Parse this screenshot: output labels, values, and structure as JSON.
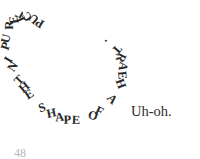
{
  "panel": {
    "background_color": "#ffffff",
    "text_color": "#272727"
  },
  "heart_caption": {
    "full_text": "PUCKER UP IN THE SHAPE OF A HEART.",
    "shape": "heart",
    "description": "caption lettering set along a heart-shaped path",
    "glyphs": [
      {
        "char": "P",
        "x": 36.0,
        "y": 17.0,
        "rot": 212
      },
      {
        "char": "U",
        "x": 29.5,
        "y": 12.5,
        "rot": 222
      },
      {
        "char": "C",
        "x": 22.5,
        "y": 10.5,
        "rot": 234
      },
      {
        "char": "K",
        "x": 15.5,
        "y": 10.5,
        "rot": 247
      },
      {
        "char": "E",
        "x": 9.5,
        "y": 13.5,
        "rot": 259
      },
      {
        "char": "R",
        "x": 5.0,
        "y": 19.0,
        "rot": 270
      },
      {
        "char": " ",
        "x": 2.5,
        "y": 25.5,
        "rot": 278
      },
      {
        "char": "U",
        "x": 1.5,
        "y": 32.5,
        "rot": 285
      },
      {
        "char": "P",
        "x": 2.0,
        "y": 40.0,
        "rot": 291
      },
      {
        "char": " ",
        "x": 3.5,
        "y": 47.0,
        "rot": 296
      },
      {
        "char": "I",
        "x": 6.0,
        "y": 53.5,
        "rot": 300
      },
      {
        "char": "N",
        "x": 8.5,
        "y": 60.5,
        "rot": 304
      },
      {
        "char": " ",
        "x": 11.5,
        "y": 67.0,
        "rot": 308
      },
      {
        "char": "T",
        "x": 15.0,
        "y": 74.0,
        "rot": 314
      },
      {
        "char": "H",
        "x": 19.5,
        "y": 81.0,
        "rot": 320
      },
      {
        "char": "E",
        "x": 25.0,
        "y": 88.0,
        "rot": 327
      },
      {
        "char": " ",
        "x": 31.0,
        "y": 94.5,
        "rot": 334
      },
      {
        "char": "S",
        "x": 38.5,
        "y": 101.5,
        "rot": 341
      },
      {
        "char": "H",
        "x": 46.5,
        "y": 107.0,
        "rot": 348
      },
      {
        "char": "A",
        "x": 55.0,
        "y": 111.0,
        "rot": 354
      },
      {
        "char": "P",
        "x": 63.5,
        "y": 113.5,
        "rot": 358
      },
      {
        "char": "E",
        "x": 72.0,
        "y": 114.0,
        "rot": 2
      },
      {
        "char": " ",
        "x": 80.0,
        "y": 112.5,
        "rot": 7
      },
      {
        "char": "O",
        "x": 88.0,
        "y": 109.5,
        "rot": 16
      },
      {
        "char": "F",
        "x": 95.5,
        "y": 105.0,
        "rot": 26
      },
      {
        "char": " ",
        "x": 101.5,
        "y": 99.5,
        "rot": 36
      },
      {
        "char": "A",
        "x": 107.5,
        "y": 93.0,
        "rot": 47
      },
      {
        "char": " ",
        "x": 112.0,
        "y": 86.0,
        "rot": 58
      },
      {
        "char": "H",
        "x": 116.0,
        "y": 77.5,
        "rot": 70
      },
      {
        "char": "E",
        "x": 118.0,
        "y": 69.0,
        "rot": 85
      },
      {
        "char": "A",
        "x": 118.5,
        "y": 60.0,
        "rot": 100
      },
      {
        "char": "R",
        "x": 116.5,
        "y": 51.5,
        "rot": 116
      },
      {
        "char": "T",
        "x": 112.5,
        "y": 43.5,
        "rot": 132
      },
      {
        "char": ".",
        "x": 106.0,
        "y": 37.0,
        "rot": 148
      }
    ]
  },
  "dialogue": {
    "uh_oh": "Uh-oh."
  },
  "footer": {
    "page_number": "48"
  }
}
